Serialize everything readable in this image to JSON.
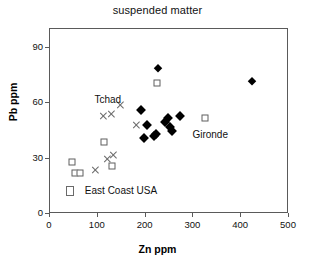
{
  "chart_data": {
    "type": "scatter",
    "title": "suspended matter",
    "xlabel": "Zn ppm",
    "ylabel": "Pb ppm",
    "xlim": [
      0,
      500
    ],
    "ylim": [
      0,
      100
    ],
    "xticks": [
      0,
      100,
      200,
      300,
      400,
      500
    ],
    "yticks": [
      0,
      30,
      60,
      90
    ],
    "xtick_labels": [
      "0",
      "100",
      "200",
      "300",
      "400",
      "500"
    ],
    "ytick_labels": [
      "0",
      "30",
      "60",
      "90"
    ],
    "grid": false,
    "legend_position": "inline-annotations",
    "annotations": [
      {
        "text": "Tchad",
        "x": 95,
        "y": 61
      },
      {
        "text": "Gironde",
        "x": 300,
        "y": 42
      },
      {
        "text": "East Coast USA",
        "x": 75,
        "y": 12
      }
    ],
    "series": [
      {
        "name": "Tchad",
        "marker": "cross",
        "color": "#6a6a6a",
        "points": [
          {
            "x": 96,
            "y": 24
          },
          {
            "x": 121,
            "y": 30
          },
          {
            "x": 132,
            "y": 32
          },
          {
            "x": 112,
            "y": 53
          },
          {
            "x": 128,
            "y": 54
          },
          {
            "x": 148,
            "y": 59
          },
          {
            "x": 180,
            "y": 48
          }
        ]
      },
      {
        "name": "East Coast USA",
        "marker": "square",
        "color": "#5f5f5f",
        "points": [
          {
            "x": 45,
            "y": 28
          },
          {
            "x": 52,
            "y": 22
          },
          {
            "x": 63,
            "y": 22
          },
          {
            "x": 113,
            "y": 39
          },
          {
            "x": 130,
            "y": 26
          },
          {
            "x": 224,
            "y": 71
          },
          {
            "x": 325,
            "y": 52
          }
        ]
      },
      {
        "name": "Gironde",
        "marker": "diamond",
        "color": "#000000",
        "points": [
          {
            "x": 190,
            "y": 56
          },
          {
            "x": 196,
            "y": 41
          },
          {
            "x": 202,
            "y": 48
          },
          {
            "x": 218,
            "y": 42
          },
          {
            "x": 222,
            "y": 43
          },
          {
            "x": 225,
            "y": 79
          },
          {
            "x": 240,
            "y": 50
          },
          {
            "x": 246,
            "y": 52
          },
          {
            "x": 250,
            "y": 47
          },
          {
            "x": 255,
            "y": 45
          },
          {
            "x": 272,
            "y": 53
          },
          {
            "x": 422,
            "y": 72
          }
        ]
      }
    ]
  },
  "legend_marker": {
    "east_coast_usa": "open-square"
  }
}
